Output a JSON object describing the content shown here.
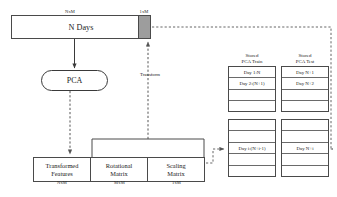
{
  "diagram": {
    "top_bar": {
      "label": "N Days",
      "dim_left": "NxM",
      "dim_right": "1xM",
      "gray_block_color": "#9d9d9d"
    },
    "pca_node": {
      "label": "PCA"
    },
    "transform_edge": {
      "label": "Transform"
    },
    "matrices": [
      {
        "label_line1": "Transformed",
        "label_line2": "Features",
        "dim": "NxM"
      },
      {
        "label_line1": "Rotational",
        "label_line2": "Matrix",
        "dim": "MxM"
      },
      {
        "label_line1": "Scaling",
        "label_line2": "Matrix",
        "dim": "1xM"
      }
    ],
    "tables": {
      "train": {
        "header_line1": "Stored",
        "header_line2": "PCA Train",
        "top_rows": [
          "Day 1:N",
          "Day 2:(N+1)",
          "",
          ""
        ],
        "bottom_rows": [
          "",
          "",
          "Day i:(N+i-1)",
          "",
          ""
        ]
      },
      "test": {
        "header_line1": "Stored",
        "header_line2": "PCA Test",
        "top_rows": [
          "Day N+1",
          "Day N+2",
          "",
          ""
        ],
        "bottom_rows": [
          "",
          "",
          "Day N+i",
          "",
          ""
        ]
      }
    }
  }
}
